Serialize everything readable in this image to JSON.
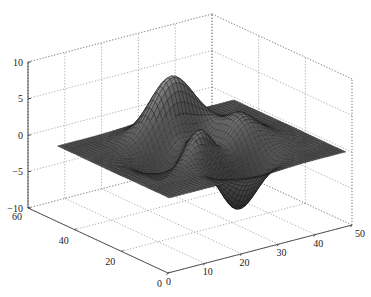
{
  "chart_data": {
    "type": "surface",
    "title": "",
    "function": "peaks",
    "grid_size": 49,
    "xlabel": "",
    "ylabel": "",
    "zlabel": "",
    "xlim": [
      0,
      50
    ],
    "ylim": [
      0,
      60
    ],
    "zlim": [
      -10,
      10
    ],
    "x_ticks": [
      0,
      10,
      20,
      30,
      40,
      50
    ],
    "y_ticks": [
      0,
      20,
      40,
      60
    ],
    "z_ticks": [
      -10,
      -5,
      0,
      5,
      10
    ],
    "grid": true,
    "colormap": "gray",
    "z_peak_max": 8.1,
    "z_peak_min": -6.5,
    "legend": null
  },
  "axes": {
    "x_tick_labels": [
      "0",
      "10",
      "20",
      "30",
      "40",
      "50"
    ],
    "y_tick_labels": [
      "0",
      "20",
      "40",
      "60"
    ],
    "z_tick_labels": [
      "-10",
      "-5",
      "0",
      "5",
      "10"
    ]
  },
  "colors": {
    "background": "#ffffff",
    "grid": "#888888",
    "axis": "#444444",
    "mesh_edge": "#1a1a1a"
  }
}
